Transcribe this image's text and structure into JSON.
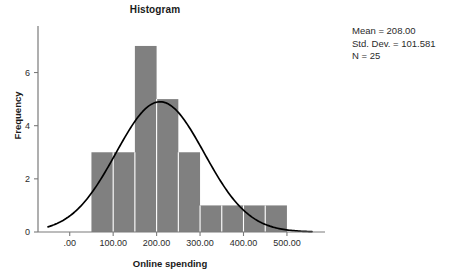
{
  "chart_data": {
    "type": "bar",
    "title": "Histogram",
    "xlabel": "Online spending",
    "ylabel": "Frequency",
    "grid": false,
    "legend": null,
    "xlim": [
      -50,
      560
    ],
    "ylim": [
      0,
      7.6
    ],
    "xticks": [
      0,
      100,
      200,
      300,
      400,
      500
    ],
    "xtick_labels": [
      ".00",
      "100.00",
      "200.00",
      "300.00",
      "400.00",
      "500.00"
    ],
    "yticks": [
      0,
      2,
      4,
      6
    ],
    "ytick_labels": [
      "0",
      "2",
      "4",
      "6"
    ],
    "bin_width": 50,
    "bin_edges": [
      50,
      100,
      150,
      200,
      250,
      300,
      350,
      400,
      450,
      500
    ],
    "categories": [
      "50-100",
      "100-150",
      "150-200",
      "200-250",
      "250-300",
      "300-350",
      "350-400",
      "400-450",
      "450-500"
    ],
    "values": [
      3,
      3,
      7,
      5,
      3,
      1,
      1,
      1,
      1
    ],
    "bar_color": "#808080",
    "bar_separator_color": "#ffffff",
    "curve_color": "#000000",
    "overlay": {
      "type": "normal-curve",
      "mean": 208.0,
      "std_dev": 101.581,
      "n": 25,
      "peak_value": 4.9,
      "peak_x": 208
    },
    "annotations": {
      "mean": "Mean = 208.00",
      "std_dev": "Std. Dev. = 101.581",
      "n": "N = 25"
    }
  },
  "stats_panel": {
    "mean": "Mean = 208.00",
    "std_dev": "Std. Dev. = 101.581",
    "n": "N = 25"
  },
  "axes": {
    "title": "Histogram",
    "x_title": "Online spending",
    "y_title": "Frequency"
  }
}
